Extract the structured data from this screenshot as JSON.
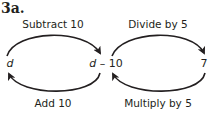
{
  "title": "3a.",
  "nodes": {
    "left": "d",
    "middle_var": "d",
    "middle_rest": " – 10",
    "right": "7"
  },
  "operations": {
    "top_left": "Subtract 10",
    "top_right": "Divide by 5",
    "bottom_left": "Add 10",
    "bottom_right": "Multiply by 5"
  },
  "colors": {
    "stroke": "#231f20",
    "text": "#231f20",
    "background": "#ffffff"
  }
}
